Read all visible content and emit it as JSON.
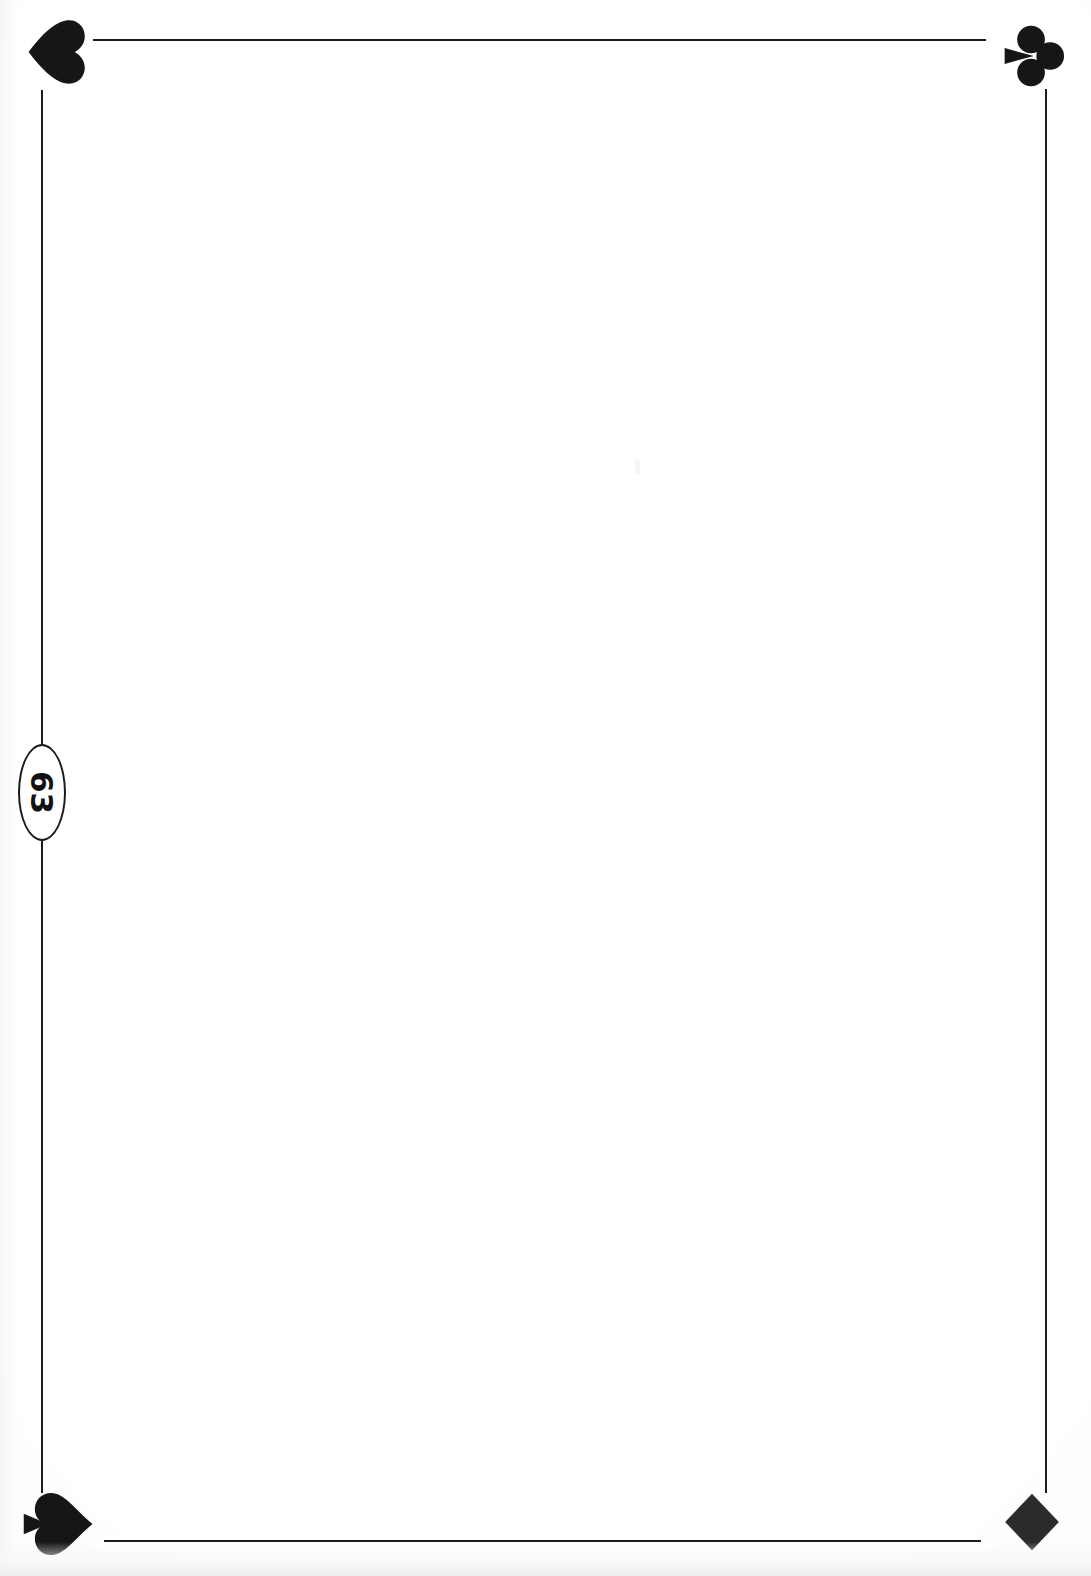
{
  "document": {
    "kind": "scanned-book-page",
    "page_number": "63",
    "body_text": "",
    "background_color": "#ffffff",
    "ink_color": "#1c1c1c"
  },
  "frame": {
    "rules": [
      {
        "name": "top-rule",
        "orientation": "horizontal"
      },
      {
        "name": "bottom-rule",
        "orientation": "horizontal"
      },
      {
        "name": "left-upper-rule",
        "orientation": "vertical"
      },
      {
        "name": "left-lower-rule",
        "orientation": "vertical"
      },
      {
        "name": "right-rule",
        "orientation": "vertical"
      }
    ],
    "ornaments": [
      {
        "name": "heart-icon",
        "suit": "heart",
        "glyph": "♥",
        "corner": "top-left",
        "rotation_deg": 90
      },
      {
        "name": "club-icon",
        "suit": "club",
        "glyph": "♣",
        "corner": "top-right",
        "rotation_deg": 90
      },
      {
        "name": "spade-icon",
        "suit": "spade",
        "glyph": "♠",
        "corner": "bottom-left",
        "rotation_deg": 90
      },
      {
        "name": "diamond-icon",
        "suit": "diamond",
        "glyph": "♦",
        "corner": "bottom-right",
        "rotation_deg": 0
      }
    ]
  },
  "page_number_medallion": {
    "label": "63",
    "shape": "ellipse",
    "text_rotation_deg": 90,
    "position": "left-margin"
  }
}
